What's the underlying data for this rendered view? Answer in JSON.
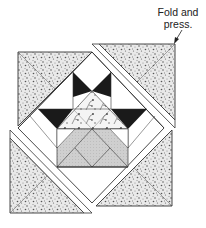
{
  "callout": {
    "line1": "Fold and",
    "line2": "press."
  },
  "diagram": {
    "colors": {
      "outline": "#333333",
      "speckled_fabric": "#e9e9e9",
      "speckle_dots": "#555555",
      "white_fabric": "#ffffff",
      "dark_fabric": "#1a1a1a",
      "basket_fabric": "#cfcfcf",
      "floral_fabric": "#f4f4f4",
      "floral_motif": "#444444"
    },
    "pieces": [
      {
        "name": "corner-setting-triangle-top-left",
        "fabric": "speckled"
      },
      {
        "name": "corner-setting-triangle-top-right",
        "fabric": "speckled"
      },
      {
        "name": "corner-setting-triangle-bottom-left",
        "fabric": "speckled"
      },
      {
        "name": "corner-setting-triangle-bottom-right",
        "fabric": "speckled"
      },
      {
        "name": "frame-strips",
        "fabric": "white"
      },
      {
        "name": "star-points",
        "fabric": "dark"
      },
      {
        "name": "center-triangle",
        "fabric": "floral"
      },
      {
        "name": "basket",
        "fabric": "gray"
      },
      {
        "name": "basket-base-triangle",
        "fabric": "white"
      }
    ]
  }
}
